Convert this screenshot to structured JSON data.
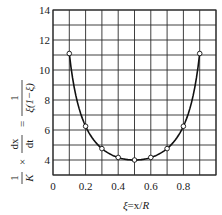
{
  "chart_data": {
    "type": "line",
    "title": "",
    "xlabel": "ξ=x/R",
    "ylabel": "1/K × dx/dt = 1/(ξ(1−ξ))",
    "xlim": [
      0,
      1.0
    ],
    "ylim": [
      3,
      14
    ],
    "grid": true,
    "legend": null,
    "x_ticks": [
      0,
      0.2,
      0.4,
      0.6,
      0.8
    ],
    "x_tick_labels": [
      "0",
      "0.2",
      "0.4",
      "0.6",
      "0.8"
    ],
    "y_ticks": [
      4,
      6,
      8,
      10,
      12,
      14
    ],
    "y_tick_labels": [
      "4",
      "6",
      "8",
      "10",
      "12",
      "14"
    ],
    "series": [
      {
        "name": "1/(ξ(1−ξ))",
        "style": "smooth curve with open circle markers",
        "x": [
          0.1,
          0.2,
          0.3,
          0.4,
          0.5,
          0.6,
          0.7,
          0.8,
          0.9
        ],
        "values": [
          11.1,
          6.25,
          4.76,
          4.17,
          4.0,
          4.17,
          4.76,
          6.25,
          11.1
        ]
      }
    ]
  },
  "labels": {
    "xlabel_xi": "ξ",
    "xlabel_rest": "=x/",
    "xlabel_R": "R",
    "y_frac1_num": "1",
    "y_frac1_den": "K",
    "y_times": "×",
    "y_frac2_num": "dx",
    "y_frac2_den": "dt",
    "y_eq": "=",
    "y_frac3_num": "1",
    "y_frac3_den": "ξ(1−ξ)"
  },
  "colors": {
    "grid": "#2a2a2a",
    "curve": "#111111",
    "marker_fill": "#ffffff"
  }
}
